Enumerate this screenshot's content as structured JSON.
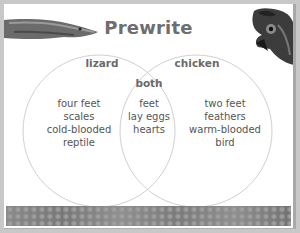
{
  "title": "Prewrite",
  "venn": {
    "left": {
      "label": "lizard",
      "items": [
        "four feet",
        "scales",
        "cold-blooded",
        "reptile"
      ]
    },
    "both": {
      "label": "both",
      "items": [
        "feet",
        "lay eggs",
        "hearts"
      ]
    },
    "right": {
      "label": "chicken",
      "items": [
        "two feet",
        "feathers",
        "warm-blooded",
        "bird"
      ]
    }
  },
  "images": {
    "top_left": "lizard-head-photo",
    "top_right": "chicken-head-photo",
    "footer": "scales-texture-banner"
  },
  "colors": {
    "title": "#6e6e6e",
    "text": "#555555",
    "circle_stroke": "#d0d0d0",
    "background": "#ffffff"
  }
}
